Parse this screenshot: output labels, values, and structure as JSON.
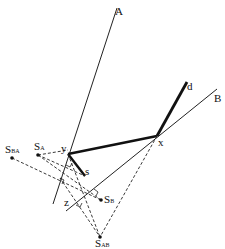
{
  "diagram": {
    "lines": {
      "A": {
        "label": "A",
        "from": [
          117,
          8
        ],
        "to": [
          53,
          204
        ]
      },
      "B": {
        "label": "B",
        "from": [
          217,
          89
        ],
        "to": [
          66,
          211
        ]
      }
    },
    "points": {
      "y": {
        "label": "y",
        "pos": [
          68,
          154
        ]
      },
      "x": {
        "label": "x",
        "pos": [
          157,
          136
        ]
      },
      "d": {
        "label": "d",
        "pos": [
          187,
          82
        ]
      },
      "s": {
        "label": "s",
        "pos": [
          85,
          176
        ]
      },
      "z": {
        "label": "z",
        "pos": [
          78,
          198
        ]
      },
      "S_BA": {
        "label": "S",
        "sub": "BA",
        "pos": [
          12,
          158
        ]
      },
      "S_A": {
        "label": "S",
        "sub": "A",
        "pos": [
          38,
          155
        ]
      },
      "S_B": {
        "label": "S",
        "sub": "B",
        "pos": [
          101,
          200
        ]
      },
      "S_AB": {
        "label": "S",
        "sub": "AB",
        "pos": [
          100,
          237
        ]
      }
    }
  }
}
